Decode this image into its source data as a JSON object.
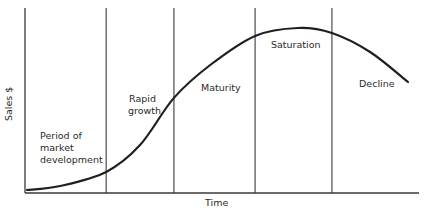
{
  "chart_data": {
    "type": "line",
    "title": "",
    "xlabel": "Time",
    "ylabel": "Sales $",
    "xlim": [
      0,
      100
    ],
    "ylim": [
      0,
      100
    ],
    "grid": false,
    "legend": "none",
    "x_ticks": [],
    "y_ticks": [],
    "phase_boundaries": [
      20.6,
      37.8,
      58.4,
      77.9
    ],
    "phases": [
      {
        "name": "Period of market development",
        "lines": [
          "Period of",
          "market",
          "development"
        ]
      },
      {
        "name": "Rapid growth",
        "lines": [
          "Rapid",
          "growth"
        ]
      },
      {
        "name": "Maturity",
        "lines": [
          "Maturity"
        ]
      },
      {
        "name": "Saturation",
        "lines": [
          "Saturation"
        ]
      },
      {
        "name": "Decline",
        "lines": [
          "Decline"
        ]
      }
    ],
    "series": [
      {
        "name": "Sales",
        "x": [
          0.5,
          8.9,
          20.6,
          29.2,
          37.8,
          47.0,
          58.4,
          69.3,
          77.9,
          87.6,
          97.2
        ],
        "y": [
          1.6,
          3.8,
          11.4,
          25.9,
          51.4,
          69.2,
          84.9,
          89.2,
          86.5,
          76.2,
          60.0
        ]
      }
    ]
  }
}
